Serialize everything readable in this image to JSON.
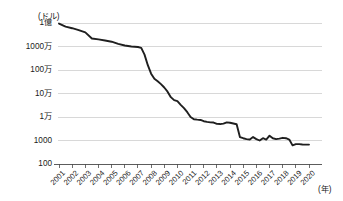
{
  "chart_data": {
    "type": "line",
    "title": "",
    "subtitle": "",
    "xlabel": "(年)",
    "ylabel": "(ドル)",
    "yscale": "log",
    "ylim": [
      100,
      100000000
    ],
    "xlim": [
      2001,
      2020
    ],
    "grid": true,
    "legend": null,
    "ytick_labels": [
      "1億",
      "1000万",
      "100万",
      "10万",
      "1万",
      "1000",
      "100"
    ],
    "ytick_values": [
      100000000,
      10000000,
      1000000,
      100000,
      10000,
      1000,
      100
    ],
    "xtick_labels": [
      "2001",
      "2002",
      "2003",
      "2004",
      "2005",
      "2006",
      "2007",
      "2008",
      "2009",
      "2010",
      "2011",
      "2012",
      "2013",
      "2014",
      "2015",
      "2016",
      "2017",
      "2018",
      "2019",
      "2020"
    ],
    "series": [
      {
        "name": "ヒトゲノム解読コスト",
        "color": "#1f1f1f",
        "x": [
          2001.0,
          2001.5,
          2002.0,
          2002.5,
          2003.0,
          2003.5,
          2004.0,
          2004.5,
          2005.0,
          2005.5,
          2006.0,
          2006.5,
          2007.0,
          2007.25,
          2007.5,
          2007.75,
          2008.0,
          2008.25,
          2008.5,
          2008.75,
          2009.0,
          2009.25,
          2009.5,
          2009.75,
          2010.0,
          2010.25,
          2010.5,
          2010.75,
          2011.0,
          2011.25,
          2011.5,
          2011.75,
          2012.0,
          2012.25,
          2012.5,
          2012.75,
          2013.0,
          2013.25,
          2013.5,
          2013.75,
          2014.0,
          2014.25,
          2014.5,
          2014.75,
          2015.0,
          2015.25,
          2015.5,
          2015.75,
          2016.0,
          2016.25,
          2016.5,
          2016.75,
          2017.0,
          2017.25,
          2017.5,
          2017.75,
          2018.0,
          2018.25,
          2018.5,
          2018.75,
          2019.0,
          2019.25,
          2019.5,
          2019.75,
          2020.0
        ],
        "values": [
          95000000,
          70000000,
          60000000,
          50000000,
          40000000,
          22000000,
          20000000,
          18000000,
          16000000,
          13000000,
          11000000,
          10000000,
          9500000,
          8800000,
          4500000,
          1600000,
          700000,
          420000,
          330000,
          250000,
          180000,
          120000,
          70000,
          52000,
          47000,
          33000,
          24000,
          16000,
          10000,
          8000,
          7700,
          7500,
          6600,
          6200,
          5900,
          5800,
          5100,
          5000,
          5200,
          5900,
          5700,
          5300,
          4900,
          1400,
          1250,
          1150,
          1100,
          1400,
          1150,
          1000,
          1250,
          1100,
          1600,
          1250,
          1150,
          1200,
          1300,
          1250,
          1100,
          620,
          700,
          700,
          680,
          670,
          670
        ]
      }
    ]
  },
  "axis": {
    "unit_y": "(ドル)",
    "unit_x": "(年)"
  }
}
